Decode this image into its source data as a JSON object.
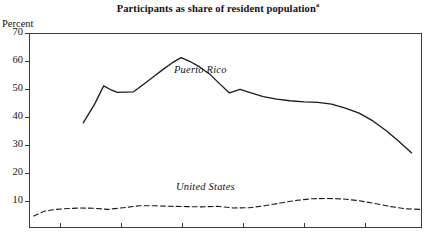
{
  "chart_data": {
    "type": "line",
    "title": "Participants as share of resident population",
    "title_footnote_marker": "a",
    "ylabel": "Percent",
    "xlabel": "",
    "ylim": [
      0.35,
      70
    ],
    "ytick_values": [
      70,
      60,
      50,
      40,
      30,
      20,
      10
    ],
    "ytick_labels": [
      "70",
      "60",
      "50",
      "40",
      "30",
      "20",
      "10"
    ],
    "xlim": [
      0,
      100
    ],
    "xtick_count": 6,
    "xtick_labels": [
      "",
      "",
      "",
      "",
      "",
      ""
    ],
    "grid": false,
    "legend_position": "inline-annotations",
    "series": [
      {
        "name": "Puerto Rico",
        "style": "solid",
        "color": "#1a1a1a",
        "x": [
          13.8,
          16.7,
          19.0,
          20.7,
          22.5,
          24.3,
          26.6,
          29.0,
          31.6,
          34.2,
          36.5,
          38.7,
          41.0,
          43.5,
          46.0,
          48.4,
          51.0,
          53.7,
          56.5,
          59.6,
          63.0,
          66.4,
          70.0,
          73.5,
          77.0,
          80.5,
          84.0,
          87.5,
          91.0,
          94.0,
          97.3
        ],
        "values": [
          37.9,
          44.6,
          51.1,
          49.8,
          48.8,
          48.9,
          49.0,
          51.5,
          54.3,
          57.1,
          59.4,
          61.2,
          59.8,
          57.8,
          55.3,
          52.0,
          48.6,
          49.9,
          48.6,
          47.3,
          46.4,
          45.8,
          45.4,
          45.2,
          44.6,
          43.2,
          41.4,
          38.6,
          35.0,
          31.4,
          27.2
        ]
      },
      {
        "name": "United States",
        "style": "dashed",
        "color": "#1a1a1a",
        "x": [
          1.2,
          4.0,
          7.0,
          10.0,
          13.0,
          16.5,
          20.0,
          24.0,
          28.0,
          32.0,
          36.0,
          40.0,
          44.0,
          48.0,
          52.0,
          56.0,
          60.0,
          64.0,
          68.0,
          72.0,
          76.0,
          80.0,
          84.0,
          88.0,
          92.0,
          96.0,
          99.5
        ],
        "values": [
          4.6,
          6.4,
          7.0,
          7.3,
          7.5,
          7.4,
          7.0,
          7.6,
          8.3,
          8.3,
          8.1,
          8.0,
          7.9,
          8.1,
          7.5,
          7.6,
          8.3,
          9.3,
          10.2,
          10.8,
          10.9,
          10.7,
          10.1,
          9.1,
          8.0,
          7.2,
          7.0
        ]
      }
    ]
  },
  "axes_geometry": {
    "left": 29,
    "right": 422,
    "top": 33,
    "bottom": 228
  }
}
